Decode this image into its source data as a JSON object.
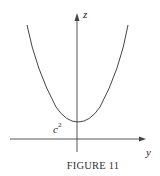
{
  "figure": {
    "caption": "FIGURE 11",
    "axes": {
      "vertical_label": "z",
      "horizontal_label": "y"
    },
    "curve": {
      "type": "parabola",
      "description": "z = y^2 + c^2 (upward-opening parabola, minimum on z-axis)",
      "min_label_base": "c",
      "min_label_exponent": "2"
    },
    "colors": {
      "stroke": "#333333",
      "background": "#ffffff"
    }
  }
}
